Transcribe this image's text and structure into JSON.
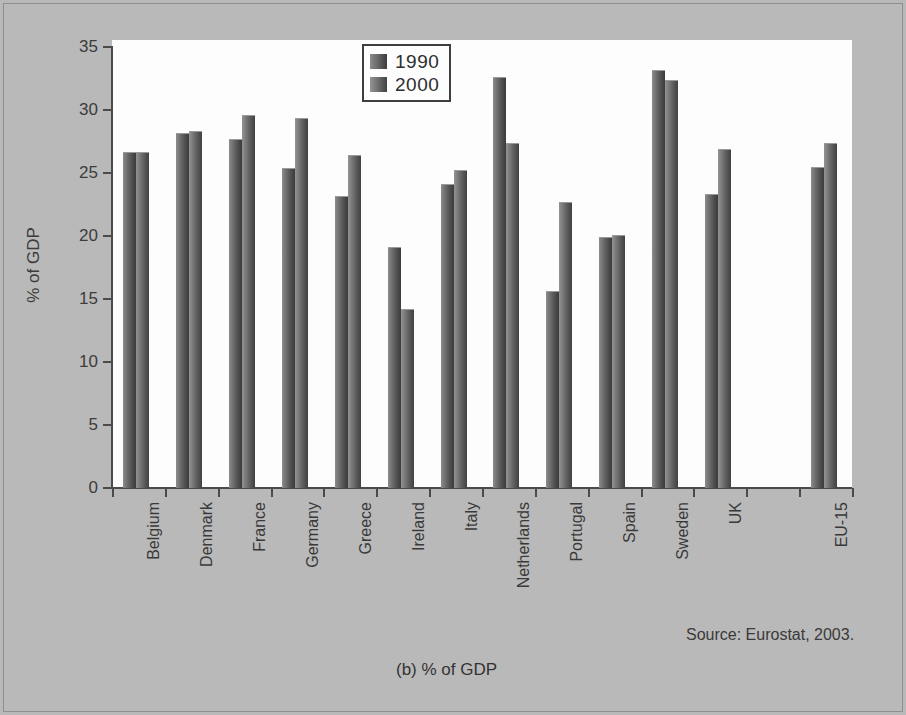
{
  "figure": {
    "caption": "(b)  % of GDP",
    "source_note": "Source: Eurostat, 2003."
  },
  "legend": {
    "position": "top-center",
    "entries": [
      {
        "label": "1990",
        "color": "#5c5c5c"
      },
      {
        "label": "2000",
        "color": "#636363"
      }
    ]
  },
  "axis": {
    "y_title": "% of GDP",
    "y_ticks": [
      "0",
      "5",
      "10",
      "15",
      "20",
      "25",
      "30",
      "35"
    ]
  },
  "chart_data": {
    "type": "bar",
    "title": "",
    "subtitle": "",
    "xlabel": "",
    "ylabel": "% of GDP",
    "ylim": [
      0,
      35
    ],
    "ytick_step": 5,
    "grid": false,
    "legend_position": "top-center",
    "categories": [
      "Belgium",
      "Denmark",
      "France",
      "Germany",
      "Greece",
      "Ireland",
      "Italy",
      "Netherlands",
      "Portugal",
      "Spain",
      "Sweden",
      "UK",
      "",
      "EU-15"
    ],
    "series": [
      {
        "name": "1990",
        "values": [
          26.7,
          28.2,
          27.7,
          25.4,
          23.2,
          19.1,
          24.1,
          32.6,
          15.6,
          19.9,
          33.2,
          23.3,
          null,
          25.5
        ]
      },
      {
        "name": "2000",
        "values": [
          26.7,
          28.3,
          29.6,
          29.4,
          26.4,
          14.2,
          25.2,
          27.4,
          22.7,
          20.1,
          32.4,
          26.9,
          null,
          27.4
        ]
      }
    ],
    "annotations": [
      "Source: Eurostat, 2003.",
      "(b)  % of GDP"
    ]
  }
}
